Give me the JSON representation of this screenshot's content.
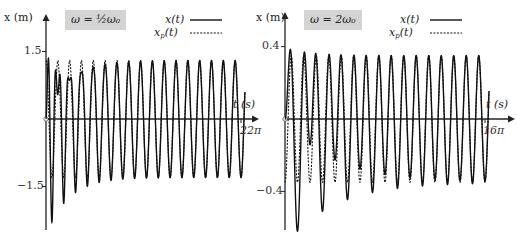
{
  "chart_data": [
    {
      "type": "line",
      "title": "ω = ½ω₀",
      "xlabel": "t (s)",
      "ylabel": "x (m)",
      "x_tick_labels": [
        "22π"
      ],
      "y_tick_labels": [
        "1.5",
        "-1.5"
      ],
      "yticks": [
        1.5,
        -1.5
      ],
      "xrange": [
        0,
        69.1
      ],
      "ylim": [
        -2.6,
        2.6
      ],
      "grid": false,
      "legend_position": "top-right",
      "omega0": 3.0,
      "omega": 1.5,
      "amplitude_particular": 1.3,
      "damping": 0.13,
      "series": [
        {
          "name": "x(t)",
          "style": "solid",
          "formula": "1.3cos(1.5t) - 1.3cos(3t)e^(-0.13t)",
          "sample_points": [
            [
              0,
              0
            ],
            [
              2.09,
              -2.29
            ],
            [
              6.28,
              -1.9
            ],
            [
              10.47,
              -1.61
            ],
            [
              14.66,
              -1.49
            ],
            [
              18.85,
              -1.41
            ],
            [
              23.04,
              -1.36
            ]
          ]
        },
        {
          "name": "x_p(t)",
          "style": "dashed",
          "formula": "1.3cos(1.5t)",
          "sample_points": [
            [
              0,
              1.3
            ],
            [
              2.09,
              -1.3
            ],
            [
              4.19,
              1.3
            ],
            [
              6.28,
              -1.3
            ]
          ]
        }
      ]
    },
    {
      "type": "line",
      "title": "ω = 2ω₀",
      "xlabel": "t (s)",
      "ylabel": "x (m)",
      "x_tick_labels": [
        "16π"
      ],
      "y_tick_labels": [
        "0.4",
        "-0.4"
      ],
      "yticks": [
        0.4,
        -0.4
      ],
      "xrange": [
        0,
        50.27
      ],
      "ylim": [
        -0.65,
        0.65
      ],
      "grid": false,
      "legend_position": "top-right",
      "omega0": 1.0,
      "omega": 2.0,
      "amplitude_particular": -0.35,
      "damping": 0.083,
      "series": [
        {
          "name": "x(t)",
          "style": "solid",
          "formula": "-0.35cos(2t) + 0.35cos(t)e^(-0.083t)",
          "sample_points": [
            [
              0,
              0
            ],
            [
              3.14,
              -0.62
            ],
            [
              9.42,
              -0.51
            ],
            [
              15.71,
              -0.44
            ],
            [
              47.12,
              -0.357
            ]
          ]
        },
        {
          "name": "x_p(t)",
          "style": "dashed",
          "formula": "-0.35cos(2t)",
          "sample_points": [
            [
              0,
              -0.35
            ],
            [
              1.57,
              0.35
            ],
            [
              3.14,
              -0.35
            ]
          ]
        }
      ]
    }
  ],
  "left": {
    "ylabel": "x (m)",
    "omega_label": "ω = ½ω₀",
    "xlabel": "t (s)",
    "tick_top": "1.5",
    "tick_bottom": "−1.5",
    "tick_x_end": "22π",
    "origin": "0",
    "legend_x": "x(t)",
    "legend_xp_main": "x",
    "legend_xp_sub": "p",
    "legend_xp_tail": "(t)"
  },
  "right": {
    "ylabel": "x (m)",
    "omega_label": "ω = 2ω₀",
    "xlabel": "t (s)",
    "tick_top": "0.4",
    "tick_bottom": "−0.4",
    "tick_x_end": "16π",
    "origin": "0",
    "legend_x": "x(t)",
    "legend_xp_main": "x",
    "legend_xp_sub": "p",
    "legend_xp_tail": "(t)"
  },
  "colors": {
    "curve": "#111111",
    "axis": "#222222",
    "box": "#d4d4d4"
  }
}
